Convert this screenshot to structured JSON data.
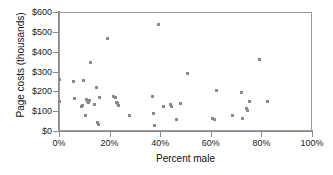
{
  "chart_data": {
    "type": "scatter",
    "title": "",
    "xlabel": "Percent male",
    "ylabel": "Page costs (thousands)",
    "xlim": [
      0,
      100
    ],
    "ylim": [
      0,
      600
    ],
    "grid": false,
    "legend": null,
    "xticks": [
      0,
      20,
      40,
      60,
      80,
      100
    ],
    "xtick_labels": [
      "0%",
      "20%",
      "40%",
      "60%",
      "80%",
      "100%"
    ],
    "yticks": [
      0,
      100,
      200,
      300,
      400,
      500,
      600
    ],
    "ytick_labels": [
      "$0",
      "$100",
      "$200",
      "$300",
      "$400",
      "$500",
      "$600"
    ],
    "marker_color": "#8a8a8a",
    "marker_size": 3,
    "points": [
      {
        "x": 0.0,
        "y": 258
      },
      {
        "x": 0.0,
        "y": 148
      },
      {
        "x": 5.9,
        "y": 250
      },
      {
        "x": 6.3,
        "y": 165
      },
      {
        "x": 8.7,
        "y": 122
      },
      {
        "x": 9.1,
        "y": 129
      },
      {
        "x": 9.5,
        "y": 253
      },
      {
        "x": 10.3,
        "y": 80
      },
      {
        "x": 10.7,
        "y": 160
      },
      {
        "x": 11.1,
        "y": 151
      },
      {
        "x": 11.5,
        "y": 145
      },
      {
        "x": 11.9,
        "y": 155
      },
      {
        "x": 12.3,
        "y": 344
      },
      {
        "x": 14.2,
        "y": 135
      },
      {
        "x": 15.0,
        "y": 220
      },
      {
        "x": 15.4,
        "y": 45
      },
      {
        "x": 15.8,
        "y": 35
      },
      {
        "x": 16.2,
        "y": 170
      },
      {
        "x": 19.0,
        "y": 468
      },
      {
        "x": 21.7,
        "y": 172
      },
      {
        "x": 22.5,
        "y": 168
      },
      {
        "x": 22.9,
        "y": 145
      },
      {
        "x": 23.3,
        "y": 140
      },
      {
        "x": 23.7,
        "y": 130
      },
      {
        "x": 27.7,
        "y": 78
      },
      {
        "x": 36.8,
        "y": 172
      },
      {
        "x": 37.2,
        "y": 90
      },
      {
        "x": 37.6,
        "y": 28
      },
      {
        "x": 39.5,
        "y": 535
      },
      {
        "x": 41.5,
        "y": 125
      },
      {
        "x": 43.9,
        "y": 133
      },
      {
        "x": 44.3,
        "y": 125
      },
      {
        "x": 46.6,
        "y": 58
      },
      {
        "x": 48.2,
        "y": 137
      },
      {
        "x": 50.6,
        "y": 290
      },
      {
        "x": 60.5,
        "y": 63
      },
      {
        "x": 61.3,
        "y": 60
      },
      {
        "x": 62.1,
        "y": 205
      },
      {
        "x": 68.4,
        "y": 78
      },
      {
        "x": 72.3,
        "y": 192
      },
      {
        "x": 72.7,
        "y": 62
      },
      {
        "x": 74.3,
        "y": 115
      },
      {
        "x": 74.7,
        "y": 105
      },
      {
        "x": 75.1,
        "y": 150
      },
      {
        "x": 79.4,
        "y": 360
      },
      {
        "x": 82.6,
        "y": 148
      }
    ]
  }
}
